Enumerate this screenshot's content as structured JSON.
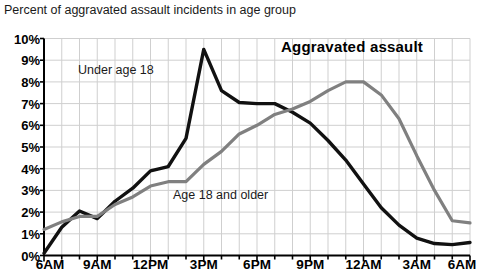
{
  "title": "Percent of aggravated assault incidents in age group",
  "subtitle": "Aggravated assault",
  "colors": {
    "series_under18": "#111111",
    "series_18plus": "#808080",
    "gridline": "#cfcfcf",
    "axis": "#000000",
    "background": "#ffffff"
  },
  "chart_data": {
    "type": "line",
    "title": "Percent of aggravated assault incidents in age group",
    "subtitle": "Aggravated assault",
    "xlabel": "",
    "ylabel": "",
    "grid": true,
    "legend_position": "inline-annotations",
    "ylim": [
      0,
      10
    ],
    "ytick_labels": [
      "0%",
      "1%",
      "2%",
      "3%",
      "4%",
      "5%",
      "6%",
      "7%",
      "8%",
      "9%",
      "10%"
    ],
    "ytick_values": [
      0,
      1,
      2,
      3,
      4,
      5,
      6,
      7,
      8,
      9,
      10
    ],
    "xtick_labels": [
      "6AM",
      "9AM",
      "12PM",
      "3PM",
      "6PM",
      "9PM",
      "12AM",
      "3AM",
      "6AM"
    ],
    "xtick_values": [
      0,
      3,
      6,
      9,
      12,
      15,
      18,
      21,
      24
    ],
    "x": [
      0,
      1,
      2,
      3,
      4,
      5,
      6,
      7,
      8,
      9,
      10,
      11,
      12,
      13,
      14,
      15,
      16,
      17,
      18,
      19,
      20,
      21,
      22,
      23,
      24
    ],
    "x_hour_labels": [
      "6AM",
      "7AM",
      "8AM",
      "9AM",
      "10AM",
      "11AM",
      "12PM",
      "1PM",
      "2PM",
      "3PM",
      "4PM",
      "5PM",
      "6PM",
      "7PM",
      "8PM",
      "9PM",
      "10PM",
      "11PM",
      "12AM",
      "1AM",
      "2AM",
      "3AM",
      "4AM",
      "5AM",
      "6AM"
    ],
    "series": [
      {
        "name": "Under age 18",
        "color": "#111111",
        "values": [
          0.1,
          1.3,
          2.05,
          1.7,
          2.5,
          3.1,
          3.9,
          4.1,
          5.4,
          9.5,
          7.6,
          7.05,
          7.0,
          7.0,
          6.6,
          6.1,
          5.3,
          4.4,
          3.3,
          2.2,
          1.4,
          0.8,
          0.55,
          0.5,
          0.6
        ]
      },
      {
        "name": "Age 18 and older",
        "color": "#808080",
        "values": [
          1.2,
          1.55,
          1.8,
          1.8,
          2.35,
          2.7,
          3.2,
          3.4,
          3.4,
          4.2,
          4.8,
          5.6,
          6.0,
          6.5,
          6.75,
          7.1,
          7.6,
          8.0,
          8.0,
          7.4,
          6.3,
          4.6,
          3.0,
          1.6,
          1.5
        ]
      }
    ],
    "annotations": [
      {
        "text": "Under age 18",
        "series": "Under age 18"
      },
      {
        "text": "Age 18 and older",
        "series": "Age 18 and older"
      }
    ]
  }
}
